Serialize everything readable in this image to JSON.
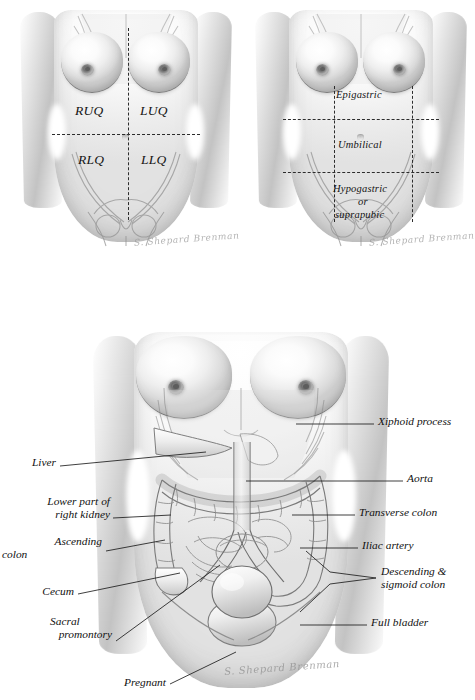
{
  "plate": {
    "title": "Abdominal regions and underlying structures",
    "background_color": "#ffffff",
    "ink_color": "#141414"
  },
  "figure_quadrants": {
    "caption": "Four quadrants of the abdomen",
    "signature": "S. Shepard Brenman",
    "labels": [
      {
        "id": "ruq",
        "text": "RUQ",
        "meaning": "right upper quadrant",
        "x": 75,
        "y": 112
      },
      {
        "id": "luq",
        "text": "LUQ",
        "meaning": "left upper quadrant",
        "x": 140,
        "y": 112
      },
      {
        "id": "rlq",
        "text": "RLQ",
        "meaning": "right lower quadrant",
        "x": 78,
        "y": 162
      },
      {
        "id": "llq",
        "text": "LLQ",
        "meaning": "left lower quadrant",
        "x": 140,
        "y": 162
      }
    ]
  },
  "figure_regions": {
    "caption": "Midline regions of the abdomen",
    "signature": "S. Shepard Brenman",
    "labels": [
      {
        "id": "epigastric",
        "text": "Epigastric",
        "x": 336,
        "y": 90
      },
      {
        "id": "umbilical",
        "text": "Umbilical",
        "x": 338,
        "y": 140
      },
      {
        "id": "hypogastric",
        "text": "Hypogastric",
        "x": 333,
        "y": 184
      },
      {
        "id": "or",
        "text": "or",
        "x": 358,
        "y": 197
      },
      {
        "id": "suprapubic",
        "text": "suprapubic",
        "x": 335,
        "y": 210
      }
    ]
  },
  "figure_anatomy": {
    "caption": "Structures palpable through the abdominal wall",
    "signature": "S. Shepard Brenman",
    "callouts_left": [
      {
        "id": "liver",
        "text": "Liver",
        "x": 27,
        "y": 463
      },
      {
        "id": "right-kidney",
        "text": "Lower part of\nright kidney",
        "line1": "Lower part of",
        "line2": "right kidney",
        "x": 48,
        "y": 502
      },
      {
        "id": "ascending-colon",
        "text": "Ascending\ncolon",
        "line1": "Ascending",
        "line2": "colon",
        "x": 44,
        "y": 542
      },
      {
        "id": "cecum",
        "text": "Cecum",
        "x": 38,
        "y": 591
      },
      {
        "id": "sacral-promontory",
        "text": "Sacral\npromontory",
        "line1": "Sacral",
        "line2": "promontory",
        "x": 52,
        "y": 622
      },
      {
        "id": "pregnant",
        "text": "Pregnant",
        "x": 92,
        "y": 682
      }
    ],
    "callouts_right": [
      {
        "id": "xiphoid-process",
        "text": "Xiphoid process",
        "x": 378,
        "y": 421
      },
      {
        "id": "aorta",
        "text": "Aorta",
        "x": 407,
        "y": 478
      },
      {
        "id": "transverse-colon",
        "text": "Transverse colon",
        "x": 359,
        "y": 512
      },
      {
        "id": "iliac-artery",
        "text": "Iliac artery",
        "x": 362,
        "y": 545
      },
      {
        "id": "descending-sigmoid-colon",
        "text": "Descending &\nsigmoid colon",
        "line1": "Descending &",
        "line2": "sigmoid colon",
        "x": 381,
        "y": 571
      },
      {
        "id": "full-bladder",
        "text": "Full bladder",
        "x": 371,
        "y": 622
      }
    ]
  }
}
